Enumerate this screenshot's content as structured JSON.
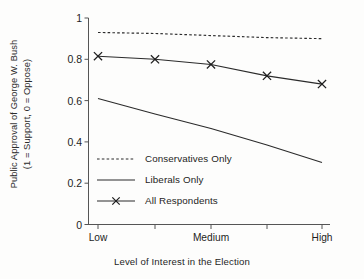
{
  "chart_data": {
    "type": "line",
    "title": "",
    "xlabel": "Level of Interest in the Election",
    "ylabel_line1": "Public Approval of George W. Bush",
    "ylabel_line2": "(1 = Support, 0 = Oppose)",
    "x": [
      1,
      2,
      3,
      4,
      5
    ],
    "categories": [
      "Low",
      "",
      "Medium",
      "",
      "High"
    ],
    "xtick_labels": [
      "Low",
      "Medium",
      "High"
    ],
    "xtick_positions": [
      1,
      3,
      5
    ],
    "ytick_labels": [
      "0",
      "0.2",
      "0.4",
      "0.6",
      "0.8",
      "1"
    ],
    "ytick_values": [
      0,
      0.2,
      0.4,
      0.6,
      0.8,
      1
    ],
    "ylim": [
      0,
      1
    ],
    "xlim": [
      0.75,
      5.25
    ],
    "grid": false,
    "legend_position": "inside-lower-left",
    "series": [
      {
        "name": "Conservatives Only",
        "style": "dashed",
        "marker": "none",
        "color": "#2b2b2b",
        "values": [
          0.93,
          0.925,
          0.915,
          0.905,
          0.9
        ]
      },
      {
        "name": "Liberals Only",
        "style": "solid",
        "marker": "none",
        "color": "#2b2b2b",
        "values": [
          0.61,
          0.535,
          0.465,
          0.385,
          0.3
        ]
      },
      {
        "name": "All Respondents",
        "style": "solid",
        "marker": "x",
        "color": "#2b2b2b",
        "values": [
          0.815,
          0.8,
          0.775,
          0.72,
          0.68
        ]
      }
    ]
  },
  "legend": {
    "items": [
      {
        "label": "Conservatives Only",
        "key": "dashed-line-key"
      },
      {
        "label": "Liberals Only",
        "key": "solid-line-key"
      },
      {
        "label": "All Respondents",
        "key": "marker-line-key"
      }
    ]
  }
}
